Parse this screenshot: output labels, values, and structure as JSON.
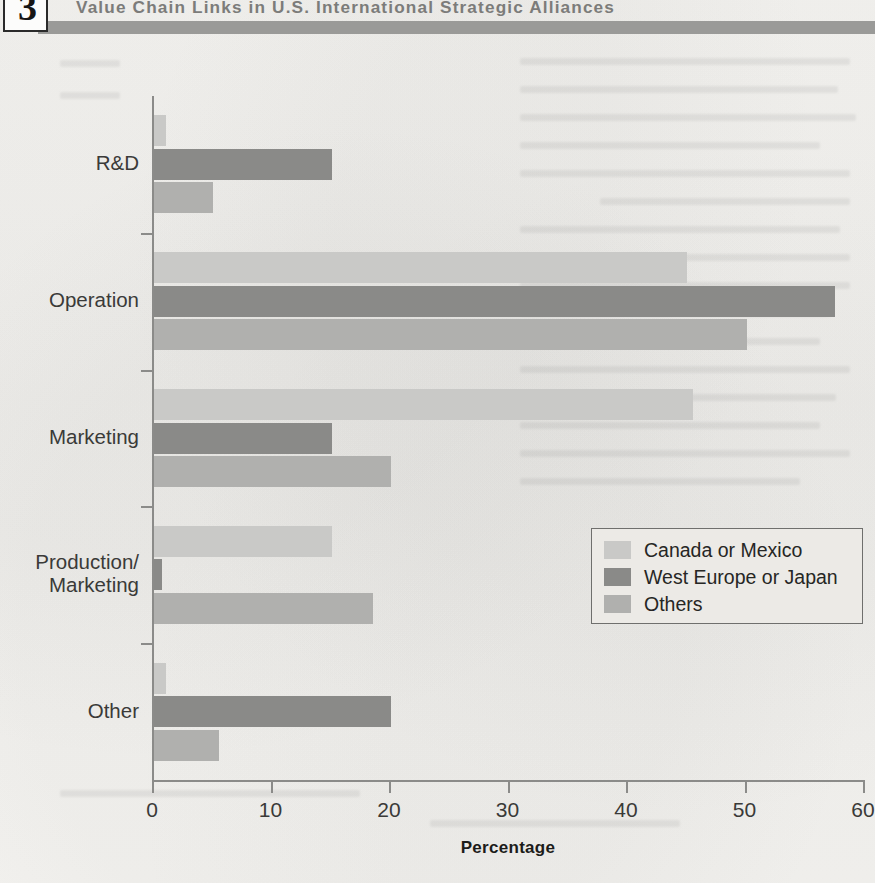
{
  "header": {
    "chapter_number": "3",
    "title": "Value Chain Links in U.S. International Strategic Alliances"
  },
  "legend": {
    "items": [
      {
        "label": "Canada or Mexico",
        "color": "#c9c9c7"
      },
      {
        "label": "West Europe or Japan",
        "color": "#8a8a88"
      },
      {
        "label": "Others",
        "color": "#b0b0ae"
      }
    ]
  },
  "axis": {
    "x_title": "Percentage",
    "x_ticks": [
      "0",
      "10",
      "20",
      "30",
      "40",
      "50",
      "60"
    ],
    "y_categories": [
      "R&D",
      "Operation",
      "Marketing",
      "Production/\nMarketing",
      "Other"
    ]
  },
  "chart_data": {
    "type": "bar",
    "orientation": "horizontal",
    "title": "Value Chain Links in U.S. International Strategic Alliances",
    "xlabel": "Percentage",
    "ylabel": "",
    "xlim": [
      0,
      60
    ],
    "xticks": [
      0,
      10,
      20,
      30,
      40,
      50,
      60
    ],
    "grid": false,
    "legend_position": "center-right",
    "categories": [
      "R&D",
      "Operation",
      "Marketing",
      "Production/Marketing",
      "Other"
    ],
    "series": [
      {
        "name": "Canada or Mexico",
        "color": "#c9c9c7",
        "values": [
          1.0,
          45.0,
          45.5,
          15.0,
          1.0
        ]
      },
      {
        "name": "West Europe or Japan",
        "color": "#8a8a88",
        "values": [
          15.0,
          57.5,
          15.0,
          0.7,
          20.0
        ]
      },
      {
        "name": "Others",
        "color": "#b0b0ae",
        "values": [
          5.0,
          50.0,
          20.0,
          18.5,
          5.5
        ]
      }
    ]
  }
}
